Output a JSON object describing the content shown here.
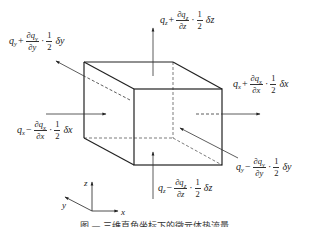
{
  "figure": {
    "type": "3d-control-volume-heat-flux",
    "caption": "图 — 三维直角坐标下的微元体热流量",
    "colors": {
      "line": "#222222",
      "background": "#ffffff"
    }
  },
  "labels": {
    "qz_plus": {
      "q": "q",
      "sub": "z",
      "sign": "+",
      "num": "∂q",
      "num_sub": "z",
      "den": "∂z",
      "half_num": "1",
      "half_den": "2",
      "delta": "δz"
    },
    "qy_plus": {
      "q": "q",
      "sub": "y",
      "sign": "+",
      "num": "∂q",
      "num_sub": "y",
      "den": "∂y",
      "half_num": "1",
      "half_den": "2",
      "delta": "δy"
    },
    "qx_plus": {
      "q": "q",
      "sub": "x",
      "sign": "+",
      "num": "∂q",
      "num_sub": "x",
      "den": "∂x",
      "half_num": "1",
      "half_den": "2",
      "delta": "δx"
    },
    "qx_minus": {
      "q": "q",
      "sub": "x",
      "sign": "−",
      "num": "∂q",
      "num_sub": "x",
      "den": "∂x",
      "half_num": "1",
      "half_den": "2",
      "delta": "δx"
    },
    "qy_minus": {
      "q": "q",
      "sub": "y",
      "sign": "−",
      "num": "∂q",
      "num_sub": "y",
      "den": "∂y",
      "half_num": "1",
      "half_den": "2",
      "delta": "δy"
    },
    "qz_minus": {
      "q": "q",
      "sub": "z",
      "sign": "−",
      "num": "∂q",
      "num_sub": "z",
      "den": "∂z",
      "half_num": "1",
      "half_den": "2",
      "delta": "δz"
    },
    "dot": "·"
  },
  "axes": {
    "x": "x",
    "y": "y",
    "z": "z"
  }
}
